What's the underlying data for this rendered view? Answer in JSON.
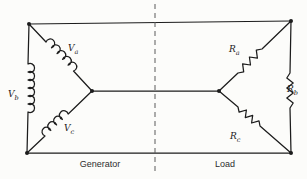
{
  "colors": {
    "background": "#fcfcfa",
    "wire": "#1c1c1c",
    "text": "#1a1a1a",
    "divider": "#5a5a5a"
  },
  "labels": {
    "generator_section": "Generator",
    "load_section": "Load"
  },
  "components": {
    "source_a": {
      "symbol": "V",
      "subscript": "a",
      "kind": "winding-coil"
    },
    "source_b": {
      "symbol": "V",
      "subscript": "b",
      "kind": "winding-coil"
    },
    "source_c": {
      "symbol": "V",
      "subscript": "c",
      "kind": "winding-coil"
    },
    "load_a": {
      "symbol": "R",
      "subscript": "a",
      "kind": "resistor"
    },
    "load_b": {
      "symbol": "R",
      "subscript": "b",
      "kind": "resistor"
    },
    "load_c": {
      "symbol": "R",
      "subscript": "c",
      "kind": "resistor"
    }
  }
}
